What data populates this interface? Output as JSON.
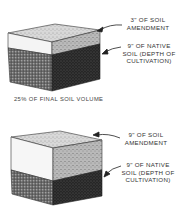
{
  "diagram": {
    "panels": [
      {
        "id": "top",
        "amendment_label": [
          "3\" OF SOIL",
          "AMENDMENT"
        ],
        "native_label": [
          "9\" OF NATIVE",
          "SOIL (DEPTH OF",
          "CULTIVATION)"
        ],
        "caption": "25% OF FINAL SOIL VOLUME"
      },
      {
        "id": "bottom",
        "amendment_label": [
          "9\" OF SOIL",
          "AMENDMENT"
        ],
        "native_label": [
          "9\" OF NATIVE",
          "SOIL (DEPTH OF",
          "CULTIVATION)"
        ]
      }
    ],
    "colors": {
      "amendment_front": "#f4f4f4",
      "amendment_top": "#dcdcdc",
      "amendment_side": "#bdbdbd",
      "native_front": "#6e6e6e",
      "native_side": "#262626",
      "ink": "#222222"
    }
  }
}
